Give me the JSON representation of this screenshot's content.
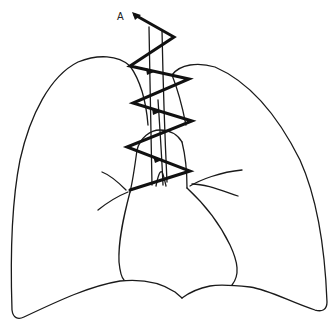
{
  "figure": {
    "type": "anatomical line drawing",
    "labels": [
      {
        "text": "A",
        "x": 117,
        "y": 11
      }
    ],
    "colors": {
      "background": "#ffffff",
      "line": "#1a1a1a",
      "suture": "#111111"
    }
  }
}
